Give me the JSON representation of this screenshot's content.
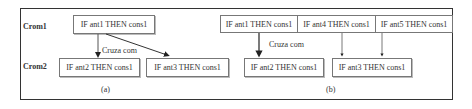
{
  "row_labels": {
    "crom1": "Crom1",
    "crom2": "Crom2"
  },
  "panel_a": {
    "crom1_rule": "IF ant1 THEN cons1",
    "crom2_rules": [
      "IF ant2 THEN cons1",
      "IF ant3 THEN cons1"
    ],
    "arrow_label": "Cruza com",
    "caption": "(a)"
  },
  "panel_b": {
    "crom1_rules": [
      "IF ant1 THEN cons1",
      "IF ant4 THEN cons1",
      "IF ant5 THEN cons1"
    ],
    "crom2_rules": [
      "IF ant2 THEN cons1",
      "IF ant3 THEN cons1"
    ],
    "arrow_label": "Cruza com",
    "caption": "(b)"
  }
}
